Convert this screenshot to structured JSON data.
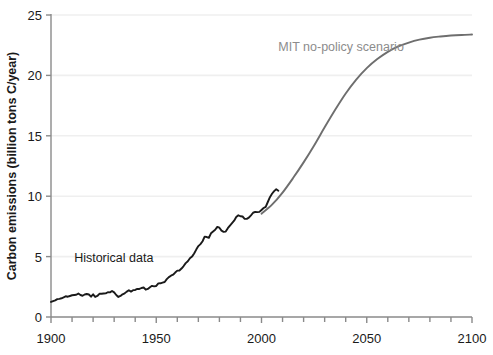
{
  "chart_data": {
    "type": "line",
    "title": "",
    "subtitle": "",
    "xlabel": "",
    "ylabel": "Carbon emissions (billion tons C/year)",
    "xlim": [
      1900,
      2100
    ],
    "ylim": [
      0,
      25
    ],
    "xticks": [
      1900,
      1950,
      2000,
      2050,
      2100
    ],
    "xtick_labels": [
      "1900",
      "1950",
      "2000",
      "2050",
      "2100"
    ],
    "xminor_step": 10,
    "yticks": [
      0,
      5,
      10,
      15,
      20,
      25
    ],
    "ytick_labels": [
      "0",
      "5",
      "10",
      "15",
      "20",
      "25"
    ],
    "grid": "horizontal",
    "grid_color": "#efefef",
    "legend": "none",
    "annotations": [
      {
        "name": "historical-data-label",
        "text": "Historical data",
        "x": 1911,
        "y": 4.55,
        "color": "#1a1a1a",
        "anchor": "start"
      },
      {
        "name": "mit-scenario-label",
        "text": "MIT no-policy scenario",
        "x": 2008,
        "y": 22.0,
        "color": "#8c8c8c",
        "anchor": "start"
      }
    ],
    "series": [
      {
        "name": "Historical data",
        "color": "#1a1a1a",
        "width": 1.9,
        "x": [
          1900,
          1901,
          1902,
          1903,
          1904,
          1905,
          1906,
          1907,
          1908,
          1909,
          1910,
          1911,
          1912,
          1913,
          1914,
          1915,
          1916,
          1917,
          1918,
          1919,
          1920,
          1921,
          1922,
          1923,
          1924,
          1925,
          1926,
          1927,
          1928,
          1929,
          1930,
          1931,
          1932,
          1933,
          1934,
          1935,
          1936,
          1937,
          1938,
          1939,
          1940,
          1941,
          1942,
          1943,
          1944,
          1945,
          1946,
          1947,
          1948,
          1949,
          1950,
          1951,
          1952,
          1953,
          1954,
          1955,
          1956,
          1957,
          1958,
          1959,
          1960,
          1961,
          1962,
          1963,
          1964,
          1965,
          1966,
          1967,
          1968,
          1969,
          1970,
          1971,
          1972,
          1973,
          1974,
          1975,
          1976,
          1977,
          1978,
          1979,
          1980,
          1981,
          1982,
          1983,
          1984,
          1985,
          1986,
          1987,
          1988,
          1989,
          1990,
          1991,
          1992,
          1993,
          1994,
          1995,
          1996,
          1997,
          1998,
          1999,
          2000,
          2001,
          2002,
          2003,
          2004,
          2005,
          2006,
          2007,
          2008
        ],
        "values": [
          1.25,
          1.32,
          1.38,
          1.48,
          1.5,
          1.55,
          1.62,
          1.72,
          1.68,
          1.74,
          1.8,
          1.82,
          1.84,
          1.94,
          1.82,
          1.76,
          1.86,
          1.9,
          1.86,
          1.68,
          1.88,
          1.66,
          1.74,
          1.92,
          1.92,
          1.94,
          1.96,
          2.05,
          2.04,
          2.16,
          2.04,
          1.82,
          1.66,
          1.74,
          1.88,
          1.96,
          2.1,
          2.22,
          2.1,
          2.22,
          2.24,
          2.32,
          2.32,
          2.4,
          2.44,
          2.26,
          2.32,
          2.46,
          2.58,
          2.54,
          2.57,
          2.78,
          2.79,
          2.85,
          2.9,
          3.13,
          3.3,
          3.42,
          3.5,
          3.68,
          3.84,
          3.85,
          4.01,
          4.22,
          4.46,
          4.61,
          4.86,
          5.0,
          5.26,
          5.58,
          5.87,
          6.03,
          6.27,
          6.65,
          6.62,
          6.56,
          6.93,
          7.08,
          7.22,
          7.46,
          7.39,
          7.15,
          7.05,
          7.07,
          7.35,
          7.57,
          7.77,
          7.97,
          8.28,
          8.42,
          8.34,
          8.32,
          8.13,
          8.12,
          8.23,
          8.42,
          8.63,
          8.7,
          8.68,
          8.7,
          8.86,
          9.02,
          9.12,
          9.52,
          9.92,
          10.2,
          10.42,
          10.58,
          10.45
        ]
      },
      {
        "name": "MIT no-policy scenario",
        "color": "#6e6e6e",
        "width": 1.9,
        "x": [
          2000,
          2005,
          2010,
          2015,
          2020,
          2025,
          2030,
          2035,
          2040,
          2045,
          2050,
          2055,
          2060,
          2065,
          2070,
          2075,
          2080,
          2085,
          2090,
          2095,
          2100
        ],
        "values": [
          8.55,
          9.3,
          10.3,
          11.5,
          12.8,
          14.2,
          15.7,
          17.15,
          18.5,
          19.65,
          20.6,
          21.35,
          21.95,
          22.4,
          22.72,
          22.96,
          23.12,
          23.22,
          23.3,
          23.35,
          23.38
        ]
      }
    ]
  },
  "axes_geometry": {
    "left_px": 51,
    "right_px": 472,
    "top_px": 15,
    "bottom_px": 317
  }
}
